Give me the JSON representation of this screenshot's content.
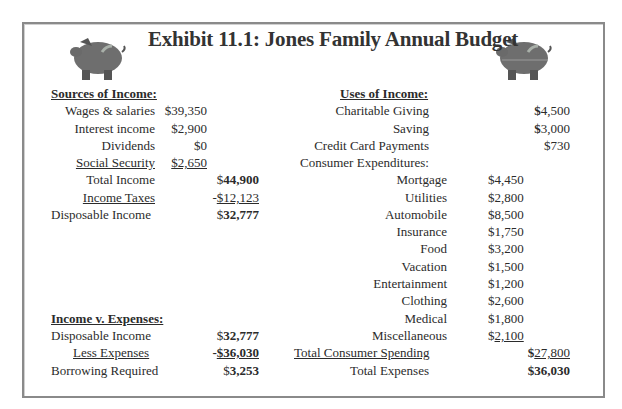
{
  "title": "Exhibit 11.1: Jones Family Annual Budget",
  "icons": {
    "left": "piggy-bank-icon",
    "right": "piggy-bank-icon"
  },
  "sources": {
    "header": "Sources of Income:",
    "items": [
      {
        "label": "Wages & salaries",
        "value": "$39,350"
      },
      {
        "label": "Interest income",
        "value": "$2,900"
      },
      {
        "label": "Dividends",
        "value": "$0"
      },
      {
        "label": "Social Security",
        "value": "$2,650"
      }
    ],
    "total_income": {
      "label": "Total Income",
      "prefix": "$",
      "value": "44,900"
    },
    "income_taxes": {
      "label": "Income Taxes",
      "prefix": "-",
      "value": "$12,123"
    },
    "disposable_income": {
      "label": "Disposable Income",
      "prefix": "$",
      "value": "32,777"
    }
  },
  "income_v_expenses": {
    "header": "Income v. Expenses:",
    "disposable_income": {
      "label": "Disposable Income",
      "prefix": "$",
      "value": "32,777"
    },
    "less_expenses": {
      "label": "Less Expenses",
      "prefix": "-",
      "value": "$36,030"
    },
    "borrowing_required": {
      "label": "Borrowing Required",
      "prefix": "$",
      "value": "3,253"
    }
  },
  "uses": {
    "header": "Uses of Income:",
    "top_items": [
      {
        "label": "Charitable Giving",
        "prefix": "$",
        "value": "4,500"
      },
      {
        "label": "Saving",
        "prefix": "$",
        "value": "3,000"
      },
      {
        "label": "Credit Card Payments",
        "prefix": "",
        "value": "$730"
      }
    ],
    "consumer_header": "Consumer Expenditures:",
    "consumer_items": [
      {
        "label": "Mortgage",
        "value": "$4,450"
      },
      {
        "label": "Utilities",
        "value": "$2,800"
      },
      {
        "label": "Automobile",
        "value": "$8,500"
      },
      {
        "label": "Insurance",
        "value": "$1,750"
      },
      {
        "label": "Food",
        "value": "$3,200"
      },
      {
        "label": "Vacation",
        "value": "$1,500"
      },
      {
        "label": "Entertainment",
        "value": "$1,200"
      },
      {
        "label": "Clothing",
        "value": "$2,600"
      },
      {
        "label": "Medical",
        "value": "$1,800"
      },
      {
        "label": "Miscellaneous",
        "prefix": "$",
        "value": "2,100"
      }
    ],
    "total_consumer_spending": {
      "label": "Total Consumer Spending",
      "prefix": "$",
      "value": "27,800"
    },
    "total_expenses": {
      "label": "Total Expenses",
      "prefix": "$",
      "value": "36,030"
    }
  }
}
